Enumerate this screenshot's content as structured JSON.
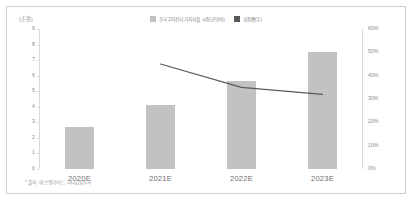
{
  "chart_data": {
    "type": "bar",
    "title": "",
    "subtitle": "",
    "categories": [
      "2020E",
      "2021E",
      "2022E",
      "2023E"
    ],
    "unit_label": "(조원)",
    "xlabel": "",
    "ylabel": "",
    "ylim": [
      0,
      9
    ],
    "y2lim": [
      0,
      0.6
    ],
    "grid": false,
    "legend_position": "top-center",
    "series": [
      {
        "name": "한국 2차전지 가치사슬 시장규모(좌)",
        "type": "bar",
        "axis": "left",
        "color": "#c2c2c2",
        "values": [
          2.7,
          4.1,
          5.65,
          7.5
        ]
      },
      {
        "name": "성장률(우)",
        "type": "line",
        "axis": "right",
        "color": "#595959",
        "values": [
          null,
          0.45,
          0.35,
          0.32
        ]
      }
    ],
    "y_ticks_left": [
      "9",
      "8",
      "7",
      "6",
      "5",
      "4",
      "3",
      "2",
      "1",
      "0"
    ],
    "y_ticks_right": [
      "60%",
      "50%",
      "40%",
      "30%",
      "20%",
      "10%",
      "0%"
    ],
    "footnote": "* 출처: 에프앤가이드, 하나금융투자",
    "colors": {
      "bar": "#c2c2c2",
      "line": "#595959",
      "axis": "#d9d9d9",
      "tick_text": "#8c8c8c",
      "category_text": "#6e6e6e",
      "border": "#d0d0d0",
      "background": "#ffffff"
    }
  },
  "legend": {
    "items": [
      {
        "label": "한국 2차전지 가치사슬 시장규모(좌)",
        "swatch": "#c2c2c2"
      },
      {
        "label": "성장률(우)",
        "swatch": "#595959"
      }
    ]
  }
}
